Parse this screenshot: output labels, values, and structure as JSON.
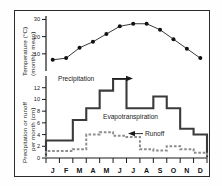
{
  "figure": {
    "background_color": "#ffffff",
    "frame_color": "#2b2b2b"
  },
  "top_panel": {
    "axis_label_line1": "Temperature (°C)",
    "axis_label_line2": "(monthly mean)",
    "ticks": [
      "10",
      "20",
      "30"
    ]
  },
  "bottom_panel": {
    "axis_label_line1": "Precipitation or runoff",
    "axis_label_line2": "per month (cm)",
    "ticks": [
      "0",
      "2",
      "4",
      "6",
      "8",
      "10",
      "12"
    ],
    "annotations": {
      "precipitation": "Precipitation",
      "evapotranspiration": "Evapotranspiration",
      "runoff": "Runoff"
    }
  },
  "months": [
    "J",
    "F",
    "M",
    "A",
    "M",
    "J",
    "J",
    "A",
    "S",
    "O",
    "N",
    "D"
  ],
  "chart_data": [
    {
      "type": "line",
      "title": "Monthly mean temperature",
      "xlabel": "",
      "ylabel": "Temperature (°C) (monthly mean)",
      "ylim": [
        0,
        32
      ],
      "categories": [
        "J",
        "F",
        "M",
        "A",
        "M",
        "J",
        "J",
        "A",
        "S",
        "O",
        "N",
        "D"
      ],
      "values": [
        6.5,
        7.5,
        13.5,
        17.0,
        21.5,
        26.0,
        27.5,
        27.5,
        24.0,
        18.5,
        13.0,
        7.5
      ],
      "marker": "filled-circle",
      "color": "#111111",
      "grid": false,
      "legend": "none"
    },
    {
      "type": "line",
      "title": "Precipitation and runoff per month",
      "xlabel": "",
      "ylabel": "Precipitation or runoff per month (cm)",
      "ylim": [
        0,
        14
      ],
      "categories": [
        "J",
        "F",
        "M",
        "A",
        "M",
        "J",
        "J",
        "A",
        "S",
        "O",
        "N",
        "D"
      ],
      "series": [
        {
          "name": "Precipitation",
          "style": "step-solid",
          "color": "#3b3b3b",
          "values": [
            3.0,
            3.0,
            6.5,
            8.5,
            11.5,
            13.5,
            8.5,
            8.5,
            10.5,
            8.5,
            5.0,
            4.0
          ]
        },
        {
          "name": "Runoff",
          "style": "step-dashed",
          "color": "#8c8c8c",
          "values": [
            1.2,
            1.2,
            1.5,
            4.0,
            4.4,
            3.8,
            3.6,
            1.5,
            1.3,
            2.0,
            1.5,
            0.9
          ]
        }
      ],
      "grid": false,
      "legend": "inline-annotations"
    }
  ]
}
